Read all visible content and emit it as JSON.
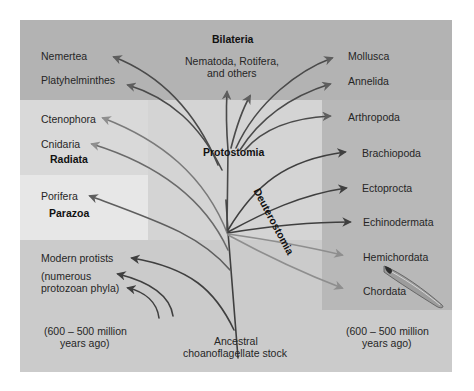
{
  "diagram": {
    "root_label": "Ancestral choanoflagellate stock",
    "root_label_lines": [
      "Ancestral",
      "choanoflagellate stock"
    ],
    "time_left": [
      "(600 – 500 million",
      "years ago)"
    ],
    "time_right": [
      "(600 – 500 million",
      "years ago)"
    ],
    "groups": {
      "bilateria": "Bilateria",
      "radiata": "Radiata",
      "parazoa": "Parazoa",
      "protostomia": "Protostomia",
      "deuterostomia": "Deuterostomia"
    },
    "bilateria_others": [
      "Nematoda, Rotifera,",
      "and others"
    ],
    "left_taxa": {
      "nemertea": "Nemertea",
      "platyhelminthes": "Platyhelminthes",
      "ctenophora": "Ctenophora",
      "cnidaria": "Cnidaria",
      "porifera": "Porifera",
      "protists": "Modern protists",
      "protozoa": [
        "(numerous",
        "protozoan phyla)"
      ]
    },
    "right_taxa": {
      "mollusca": "Mollusca",
      "annelida": "Annelida",
      "arthropoda": "Arthropoda",
      "brachiopoda": "Brachiopoda",
      "ectoprocta": "Ectoprocta",
      "echinodermata": "Echinodermata",
      "hemichordata": "Hemichordata",
      "chordata": "Chordata"
    },
    "icons": {
      "chordate": "fish-like chordate illustration"
    },
    "colors": {
      "outer_bg": "#c3c3c3",
      "bilateria_band": "#b4b4b4",
      "radiata_box": "#d9d9d9",
      "parazoa_box": "#e6e6e6",
      "center_panel": "#d3d3d3",
      "right_panel": "#b9b9b9",
      "bottom_region": "#cbcbcb",
      "branch_dark": "#3f3f3f",
      "branch_mid": "#6a6a6a",
      "branch_light": "#8c8c8c"
    }
  }
}
